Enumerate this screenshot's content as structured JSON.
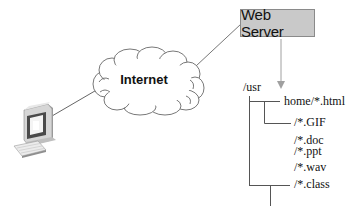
{
  "diagram": {
    "type": "network-architecture",
    "nodes": {
      "client": {
        "label": "",
        "icon": "desktop-computer-icon"
      },
      "internet": {
        "label": "Internet",
        "icon": "cloud-icon"
      },
      "server": {
        "label": "Web Server"
      }
    },
    "edges": [
      {
        "from": "client",
        "to": "internet",
        "style": "line"
      },
      {
        "from": "internet",
        "to": "server",
        "style": "line"
      },
      {
        "from": "server",
        "to": "filesystem",
        "style": "arrow"
      }
    ],
    "filesystem": {
      "root": "/usr",
      "entries": [
        {
          "label": "home/*.html",
          "level": 1
        },
        {
          "label": "/*.GIF",
          "level": 2
        },
        {
          "label": "/*.doc",
          "level": 2
        },
        {
          "label": "/*.ppt",
          "level": 2
        },
        {
          "label": "/*.wav",
          "level": 2
        },
        {
          "label": "/*.class",
          "level": 2
        }
      ]
    },
    "colors": {
      "server_fill": "#c9c9c9",
      "server_border": "#8a8a8a",
      "line": "#666666",
      "arrow": "#999999"
    }
  }
}
